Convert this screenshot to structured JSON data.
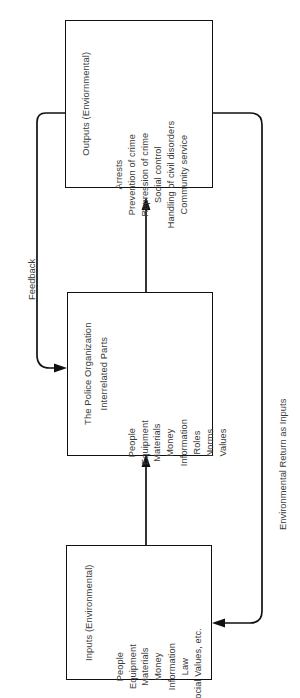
{
  "diagram": {
    "boxes": [
      {
        "id": "outputs",
        "title": "Outputs (Enviornmental)",
        "items": [
          "Arrests",
          "Prevention of crime",
          "Repression of crime",
          "Social control",
          "Handling of civil disorders",
          "Community service"
        ]
      },
      {
        "id": "police",
        "title": "The Police Organization",
        "subtitle": "Interrelated Parts",
        "items": [
          "People",
          "Equipment",
          "Materials",
          "Money",
          "Information",
          "Roles",
          "Norms",
          "Values"
        ]
      },
      {
        "id": "inputs",
        "title": "Inputs (Environmental)",
        "items": [
          "People",
          "Equipment",
          "Materials",
          "Money",
          "Information",
          "Law",
          "Social Values, etc."
        ]
      }
    ],
    "flow_labels": {
      "feedback": "Feedback",
      "environmental_return": "Environmental Return as Inputs"
    },
    "colors": {
      "stroke": "#111111",
      "text": "#3a3a3a",
      "background": "#ffffff"
    }
  }
}
